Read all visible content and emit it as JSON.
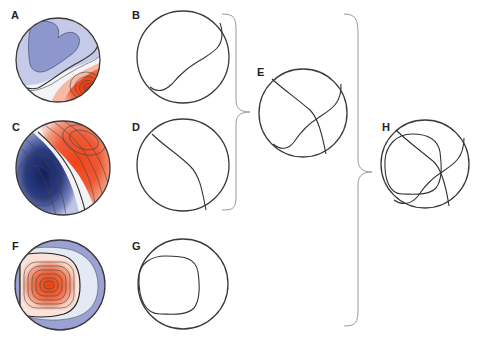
{
  "figure": {
    "panels": [
      {
        "id": "A",
        "label": "A",
        "type": "colored-topographic-map",
        "description": "blue negative region upper-left, red positive region lower-right"
      },
      {
        "id": "B",
        "label": "B",
        "type": "zero-line-contour",
        "description": "zero-isocontour of map A"
      },
      {
        "id": "C",
        "label": "C",
        "type": "colored-topographic-map",
        "description": "dark blue region lower-left, red region upper-right"
      },
      {
        "id": "D",
        "label": "D",
        "type": "zero-line-contour",
        "description": "zero-isocontour of map C"
      },
      {
        "id": "E",
        "label": "E",
        "type": "combined-contours",
        "description": "overlay of B and D"
      },
      {
        "id": "F",
        "label": "F",
        "type": "colored-topographic-map",
        "description": "red peak left-center surrounded by light and blue rings"
      },
      {
        "id": "G",
        "label": "G",
        "type": "zero-line-contour",
        "description": "zero-isocontour of map F"
      },
      {
        "id": "H",
        "label": "H",
        "type": "combined-contours",
        "description": "overlay of E and G"
      }
    ],
    "braces": [
      {
        "from": [
          "B",
          "D"
        ],
        "to": "E"
      },
      {
        "from": [
          "E",
          "G"
        ],
        "to": "H"
      }
    ],
    "caption": "",
    "colors": {
      "red_strong": "#e8421c",
      "red_mid": "#ef7a5a",
      "red_light": "#f6b9a6",
      "neutral": "#f3f3f6",
      "blue_light": "#c3c9e6",
      "blue_mid": "#8f98cf",
      "blue_dark": "#1e2c6e",
      "line": "#3a3a3a",
      "brace": "#9a9a9a"
    }
  }
}
